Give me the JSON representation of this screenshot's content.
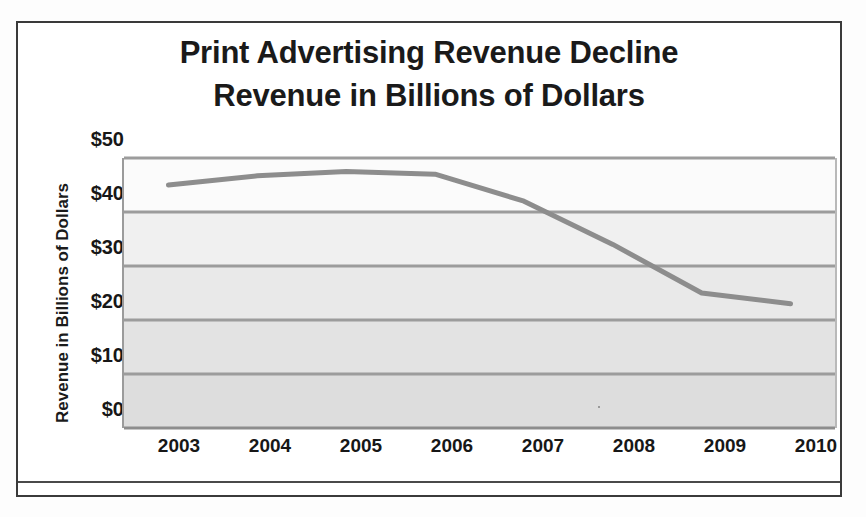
{
  "chart_data": {
    "type": "line",
    "title": "Print Advertising Revenue Decline",
    "subtitle": "Revenue in Billions of Dollars",
    "title_lines": [
      "Print Advertising Revenue Decline",
      "Revenue in Billions of Dollars"
    ],
    "xlabel": "",
    "ylabel": "Revenue in Billions of Dollars",
    "categories": [
      "2003",
      "2004",
      "2005",
      "2006",
      "2007",
      "2008",
      "2009",
      "2010"
    ],
    "x": [
      2003,
      2004,
      2005,
      2006,
      2007,
      2008,
      2009,
      2010
    ],
    "values": [
      45,
      46.7,
      47.5,
      47,
      42,
      34,
      25,
      23
    ],
    "series": [
      {
        "name": "Print advertising revenue",
        "values": [
          45,
          46.7,
          47.5,
          47,
          42,
          34,
          25,
          23
        ],
        "color": "#8d8d8d"
      }
    ],
    "ylim": [
      0,
      50
    ],
    "y_ticks": [
      0,
      10,
      20,
      30,
      40,
      50
    ],
    "y_tick_labels": [
      "$0",
      "$10",
      "$20",
      "$30",
      "$40",
      "$50"
    ],
    "x_tick_labels": [
      "2003",
      "2004",
      "2005",
      "2006",
      "2007",
      "2008",
      "2009",
      "2010"
    ],
    "grid": true,
    "grid_axis": "y",
    "legend": false,
    "legend_position": "none",
    "units": "Billions of Dollars",
    "currency_symbol": "$"
  },
  "style": {
    "line_color": "#8d8d8d",
    "gridline_color": "#9c9c9c",
    "plot_background_top": "#fbfbfb",
    "plot_background_bottom": "#dddddd",
    "text_color": "#171717",
    "frame_color": "#3a3a3a"
  }
}
